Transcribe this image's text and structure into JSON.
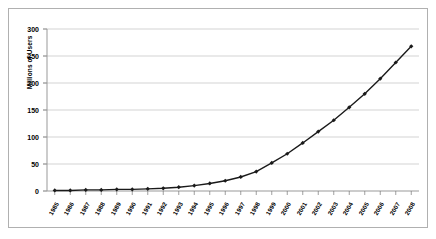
{
  "chart_data": {
    "type": "line",
    "title": "",
    "xlabel": "",
    "ylabel": "Millions of Users",
    "ylim": [
      0,
      300
    ],
    "yticks": [
      0,
      50,
      100,
      150,
      200,
      250,
      300
    ],
    "grid": true,
    "legend": "none",
    "marker": "diamond",
    "series_color": "#1a1a1a",
    "grid_color": "#c8c8c8",
    "border_color": "#b0b0b0",
    "categories": [
      "1985",
      "1986",
      "1987",
      "1988",
      "1989",
      "1990",
      "1991",
      "1992",
      "1993",
      "1994",
      "1995",
      "1996",
      "1997",
      "1998",
      "1999",
      "2000",
      "2001",
      "2002",
      "2003",
      "2004",
      "2005",
      "2006",
      "2007",
      "2008"
    ],
    "series": [
      {
        "name": "Internet Users",
        "values": [
          1,
          1,
          2,
          2,
          3,
          3,
          4,
          5,
          7,
          10,
          14,
          19,
          26,
          36,
          52,
          69,
          89,
          110,
          131,
          155,
          180,
          208,
          238,
          268
        ]
      }
    ]
  }
}
